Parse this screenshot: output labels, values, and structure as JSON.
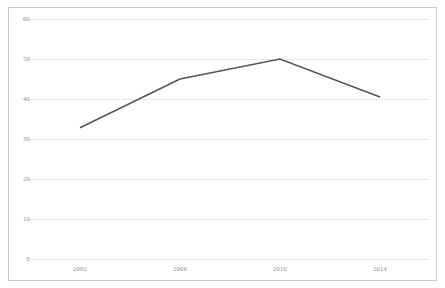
{
  "chart_data": {
    "type": "line",
    "title": "",
    "subtitle": "",
    "xlabel": "",
    "ylabel": "",
    "categories": [
      "2002",
      "2006",
      "2010",
      "2014"
    ],
    "x": [
      2002,
      2006,
      2010,
      2014
    ],
    "values": [
      32.8,
      45,
      50,
      40.5
    ],
    "series": [
      {
        "name": "",
        "values": [
          32.8,
          45,
          50,
          40.5
        ]
      }
    ],
    "xlim": [
      2000,
      2016
    ],
    "ylim": [
      0,
      60
    ],
    "yticks": [
      0,
      10,
      20,
      30,
      40,
      50,
      60
    ],
    "ytick_labels": [
      "0",
      "10",
      "20",
      "30",
      "40",
      "50",
      "60"
    ],
    "xticks": [
      2002,
      2006,
      2010,
      2014
    ],
    "xtick_labels": [
      "2002",
      "2006",
      "2010",
      "2014"
    ],
    "grid": "horizontal",
    "legend": "none",
    "colors": {
      "line": "#555555",
      "grid": "#e8e8e8",
      "frame": "#c8c8c8",
      "tick_text": "#8a8a8a",
      "background": "#ffffff"
    },
    "annotations": []
  },
  "axes": {
    "y_ticks": [
      {
        "label": "60",
        "value": 60
      },
      {
        "label": "50",
        "value": 50
      },
      {
        "label": "40",
        "value": 40
      },
      {
        "label": "30",
        "value": 30
      },
      {
        "label": "20",
        "value": 20
      },
      {
        "label": "10",
        "value": 10
      },
      {
        "label": "0",
        "value": 0
      }
    ],
    "x_ticks": [
      {
        "label": "2002",
        "value": 2002
      },
      {
        "label": "2006",
        "value": 2006
      },
      {
        "label": "2010",
        "value": 2010
      },
      {
        "label": "2014",
        "value": 2014
      }
    ]
  }
}
